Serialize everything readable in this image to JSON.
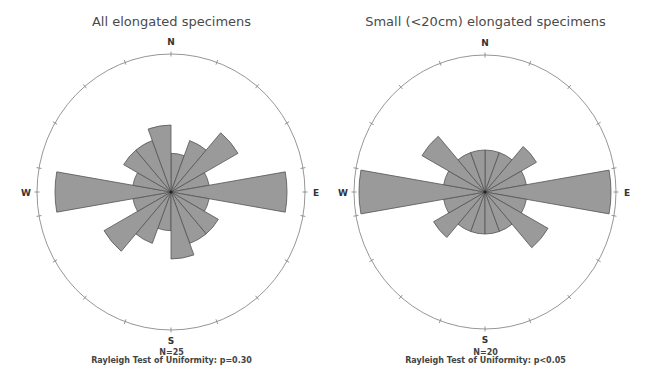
{
  "chart_data": [
    {
      "type": "rose",
      "title": "All elongated specimens",
      "axial": true,
      "bin_width_deg": 20,
      "scale": "sqrt (equal-area)",
      "bins": [
        "0-20",
        "20-40",
        "40-60",
        "60-80",
        "80-100",
        "100-120",
        "120-140",
        "140-160",
        "160-180"
      ],
      "counts": [
        1,
        2,
        4,
        1,
        9,
        1,
        2,
        2,
        3
      ],
      "direction_labels": [
        "N",
        "E",
        "S",
        "W"
      ],
      "n_label": "N=25",
      "stat_label": "Rayleigh Test of Uniformity: p=0.30",
      "center": [
        171,
        192
      ],
      "rx": 134,
      "ry": 138,
      "max_r": 116
    },
    {
      "type": "rose",
      "title": "Small (<20cm) elongated specimens",
      "axial": true,
      "bin_width_deg": 20,
      "scale": "sqrt (equal-area)",
      "bins": [
        "0-20",
        "20-40",
        "40-60",
        "60-80",
        "80-100",
        "100-120",
        "120-140",
        "140-160",
        "160-180"
      ],
      "counts": [
        1,
        1,
        2,
        1,
        9,
        1,
        3,
        1,
        1
      ],
      "direction_labels": [
        "N",
        "E",
        "S",
        "W"
      ],
      "n_label": "N=20",
      "stat_label": "Rayleigh Test of Uniformity: p<0.05",
      "center": [
        485,
        192
      ],
      "rx": 131,
      "ry": 137,
      "max_r": 126
    }
  ],
  "colors": {
    "bar_fill": "#9a9a9a",
    "bar_stroke": "#555555",
    "circle": "#8a8a8a",
    "text": "#444444"
  }
}
